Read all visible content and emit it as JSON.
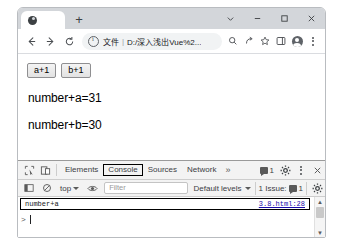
{
  "window": {
    "tab": {
      "title": "",
      "favicon": "page-favicon"
    },
    "new_tab_label": "+",
    "controls": {
      "tab_search": "tab-search-chevron",
      "minimize": "minimize",
      "maximize": "maximize",
      "close": "close"
    }
  },
  "toolbar": {
    "back": "back-arrow",
    "forward": "forward-arrow",
    "reload": "reload",
    "omnibox": {
      "security_icon": "info-circle",
      "scheme_label": "文件",
      "separator": "|",
      "url": "D:/深入浅出Vue%2...",
      "placeholder": "搜索或输入网址"
    },
    "icons": {
      "zoom": "zoom-search",
      "share": "share",
      "bookmark": "star",
      "side_panel": "side-panel",
      "profile": "profile-avatar",
      "menu": "three-dot-menu"
    }
  },
  "page": {
    "buttons": [
      {
        "label": "a+1"
      },
      {
        "label": "b+1"
      }
    ],
    "lines": [
      "number+a=31",
      "number+b=30"
    ]
  },
  "devtools": {
    "inspect_icon": "inspect-element",
    "device_icon": "device-toolbar",
    "tabs": [
      {
        "label": "Elements",
        "selected": false
      },
      {
        "label": "Console",
        "selected": true
      },
      {
        "label": "Sources",
        "selected": false
      },
      {
        "label": "Network",
        "selected": false
      }
    ],
    "more_tabs": "»",
    "message_count": "1",
    "settings_icon": "gear",
    "menu_icon": "three-dot-menu",
    "close_icon": "close",
    "console_toolbar": {
      "sidebar_toggle": "console-sidebar",
      "clear_console": "clear-console",
      "context": "top",
      "eye_icon": "live-expression-eye",
      "filter_placeholder": "Filter",
      "levels": "Default levels",
      "issues_label": "1 Issue:",
      "issues_count": "1"
    },
    "console": {
      "entries": [
        {
          "text": "number+a",
          "source": "3.8.html:28"
        }
      ],
      "prompt": ">"
    }
  }
}
